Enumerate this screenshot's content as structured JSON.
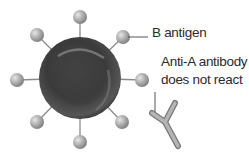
{
  "diagram": {
    "labels": {
      "antigen": "B antigen",
      "antibody_line1": "Anti-A antibody",
      "antibody_line2": "does not react"
    },
    "colors": {
      "cell_dark": "#2e2e2e",
      "cell_mid": "#5a5a5a",
      "antigen": "#a8a8a8",
      "stalk": "#8a8a8a",
      "antibody": "#9a9a9a",
      "text": "#2a2a2a"
    }
  }
}
